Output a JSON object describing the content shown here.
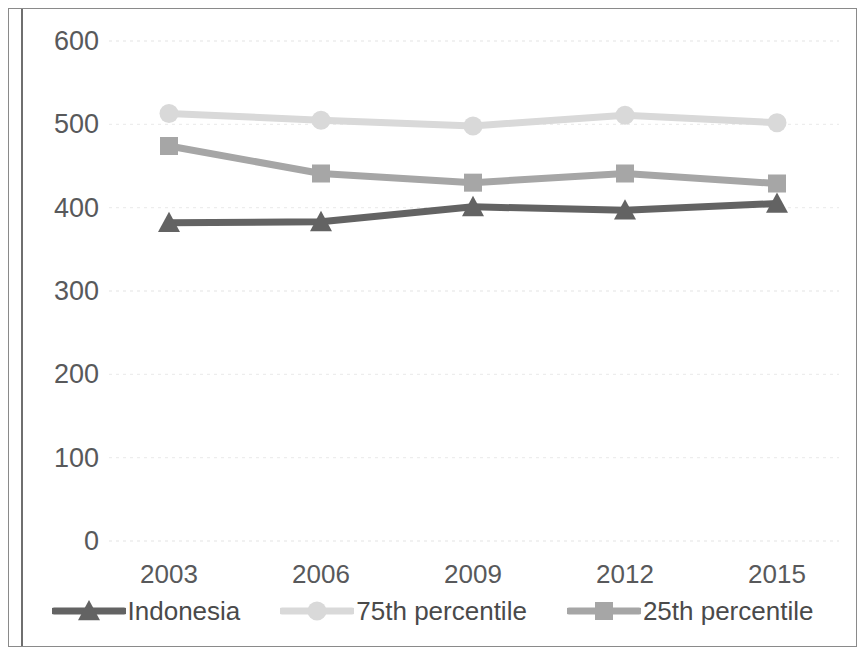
{
  "chart_data": {
    "type": "line",
    "title": "",
    "subtitle": "",
    "xlabel": "",
    "ylabel": "",
    "categories": [
      "2003",
      "2006",
      "2009",
      "2012",
      "2015"
    ],
    "x_tick_labels": [
      "2003",
      "2006",
      "2009",
      "2012",
      "2015"
    ],
    "y_tick_labels": [
      "600",
      "500",
      "400",
      "300",
      "200",
      "100",
      "0"
    ],
    "y_ticks": [
      600,
      500,
      400,
      300,
      200,
      100,
      0
    ],
    "ylim": [
      0,
      600
    ],
    "grid": true,
    "grid_style": "dotted-horizontal",
    "legend_position": "bottom",
    "series": [
      {
        "name": "Indonesia",
        "marker": "triangle",
        "color": "#636363",
        "values": [
          382,
          383,
          401,
          397,
          405
        ]
      },
      {
        "name": "75th percentile",
        "marker": "circle",
        "color": "#d9d9d9",
        "values": [
          513,
          505,
          498,
          511,
          502
        ]
      },
      {
        "name": "25th percentile",
        "marker": "square",
        "color": "#a6a6a6",
        "values": [
          474,
          441,
          430,
          441,
          429
        ]
      }
    ]
  },
  "legend": {
    "items": [
      {
        "label": "Indonesia",
        "marker": "triangle-marker-icon",
        "color": "#636363"
      },
      {
        "label": "75th percentile",
        "marker": "circle-marker-icon",
        "color": "#d9d9d9"
      },
      {
        "label": "25th percentile",
        "marker": "square-marker-icon",
        "color": "#a6a6a6"
      }
    ]
  },
  "colors": {
    "frame_border": "#8a8a8a",
    "axis_line": "#6f6f6f",
    "tick_text": "#58595b",
    "gridline": "#ededed",
    "background": "#ffffff"
  }
}
